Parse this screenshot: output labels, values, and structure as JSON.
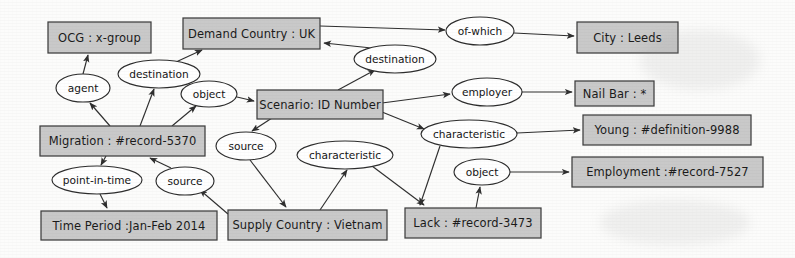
{
  "diagram": {
    "type": "entity-relationship-graph",
    "style": {
      "entity_fill": "#c9c9c9",
      "entity_stroke": "#3d3d3d",
      "relation_fill": "#ffffff",
      "relation_stroke": "#2c2c2c",
      "background": "#fcfcfb"
    },
    "entities": [
      {
        "id": "ocg",
        "label": "OCG : x-group",
        "x": 48,
        "y": 22,
        "w": 103,
        "h": 31
      },
      {
        "id": "demand",
        "label": "Demand Country : UK",
        "x": 183,
        "y": 18,
        "w": 137,
        "h": 31
      },
      {
        "id": "city",
        "label": "City : Leeds",
        "x": 577,
        "y": 22,
        "w": 101,
        "h": 31
      },
      {
        "id": "scenario",
        "label": "Scenario: ID Number",
        "x": 257,
        "y": 90,
        "w": 126,
        "h": 29
      },
      {
        "id": "nailbar",
        "label": "Nail Bar : *",
        "x": 575,
        "y": 81,
        "w": 79,
        "h": 25
      },
      {
        "id": "young",
        "label": "Young : #definition-9988",
        "x": 583,
        "y": 115,
        "w": 168,
        "h": 30
      },
      {
        "id": "migration",
        "label": "Migration : #record-5370",
        "x": 40,
        "y": 126,
        "w": 165,
        "h": 30
      },
      {
        "id": "employ",
        "label": "Employment :#record-7527",
        "x": 572,
        "y": 157,
        "w": 191,
        "h": 30
      },
      {
        "id": "timeper",
        "label": "Time Period :Jan-Feb 2014",
        "x": 41,
        "y": 211,
        "w": 176,
        "h": 29
      },
      {
        "id": "supply",
        "label": "Supply Country : Vietnam",
        "x": 228,
        "y": 210,
        "w": 159,
        "h": 30
      },
      {
        "id": "lack",
        "label": "Lack : #record-3473",
        "x": 405,
        "y": 208,
        "w": 136,
        "h": 30
      }
    ],
    "relations": [
      {
        "id": "agent",
        "label": "agent",
        "cx": 83,
        "cy": 88,
        "rx": 27,
        "ry": 14
      },
      {
        "id": "dest1",
        "label": "destination",
        "cx": 159,
        "cy": 74,
        "rx": 41,
        "ry": 14
      },
      {
        "id": "object1",
        "label": "object",
        "cx": 209,
        "cy": 94,
        "rx": 28,
        "ry": 13
      },
      {
        "id": "dest2",
        "label": "destination",
        "cx": 395,
        "cy": 59,
        "rx": 41,
        "ry": 14
      },
      {
        "id": "ofwhich",
        "label": "of-which",
        "cx": 480,
        "cy": 31,
        "rx": 34,
        "ry": 14
      },
      {
        "id": "employer",
        "label": "employer",
        "cx": 487,
        "cy": 92,
        "rx": 35,
        "ry": 14
      },
      {
        "id": "charac1",
        "label": "characteristic",
        "cx": 469,
        "cy": 134,
        "rx": 48,
        "ry": 14
      },
      {
        "id": "object2",
        "label": "object",
        "cx": 482,
        "cy": 172,
        "rx": 28,
        "ry": 13
      },
      {
        "id": "source1",
        "label": "source",
        "cx": 246,
        "cy": 146,
        "rx": 30,
        "ry": 14
      },
      {
        "id": "charac2",
        "label": "characteristic",
        "cx": 345,
        "cy": 155,
        "rx": 48,
        "ry": 14
      },
      {
        "id": "pit",
        "label": "point-in-time",
        "cx": 97,
        "cy": 180,
        "rx": 45,
        "ry": 14
      },
      {
        "id": "source2",
        "label": "source",
        "cx": 185,
        "cy": 181,
        "rx": 29,
        "ry": 14
      }
    ],
    "edges": [
      {
        "from": "migration",
        "to": "agent",
        "path": "M 110 126 L 90 103",
        "arrow_at": [
          85,
          100
        ]
      },
      {
        "from": "agent",
        "to": "ocg",
        "path": "M 83 74 L 88 55",
        "arrow_at": [
          89,
          53
        ]
      },
      {
        "from": "migration",
        "to": "dest1",
        "path": "M 140 126 L 154 89",
        "arrow_at": [
          156,
          87
        ]
      },
      {
        "from": "dest1",
        "to": "demand",
        "path": "M 176 62 L 202 50",
        "arrow_at": [
          205,
          49
        ]
      },
      {
        "from": "migration",
        "to": "object1",
        "path": "M 172 126 L 196 106",
        "arrow_at": [
          199,
          104
        ]
      },
      {
        "from": "object1",
        "to": "scenario",
        "path": "M 237 97 L 254 101",
        "arrow_at": [
          256,
          102
        ]
      },
      {
        "from": "scenario",
        "to": "dest2",
        "path": "M 338 90 L 375 70",
        "arrow_at": [
          378,
          68
        ]
      },
      {
        "from": "dest2",
        "to": "demand",
        "path": "M 381 49 L 324 43",
        "arrow_at": [
          321,
          42
        ]
      },
      {
        "from": "demand",
        "to": "ofwhich",
        "path": "M 320 26 L 445 30",
        "arrow_at": [
          447,
          30
        ]
      },
      {
        "from": "ofwhich",
        "to": "city",
        "path": "M 514 33 L 574 36",
        "arrow_at": [
          576,
          36
        ]
      },
      {
        "from": "scenario",
        "to": "employer",
        "path": "M 382 103 L 450 94",
        "arrow_at": [
          452,
          94
        ]
      },
      {
        "from": "employer",
        "to": "nailbar",
        "path": "M 522 92 L 572 92",
        "arrow_at": [
          574,
          92
        ]
      },
      {
        "from": "scenario",
        "to": "charac1",
        "path": "M 382 112 L 424 129",
        "arrow_at": [
          427,
          131
        ]
      },
      {
        "from": "charac1",
        "to": "young",
        "path": "M 517 133 L 580 130",
        "arrow_at": [
          582,
          130
        ]
      },
      {
        "from": "object2",
        "to": "employ",
        "path": "M 510 172 L 569 172",
        "arrow_at": [
          571,
          172
        ]
      },
      {
        "from": "lack",
        "to": "object2",
        "path": "M 476 208 L 480 187",
        "arrow_at": [
          481,
          185
        ]
      },
      {
        "from": "charac1",
        "to": "lack",
        "path": "M 440 146 L 420 205",
        "arrow_at": [
          419,
          207
        ]
      },
      {
        "from": "scenario",
        "to": "source1",
        "path": "M 272 118 L 252 131",
        "arrow_at": [
          250,
          133
        ]
      },
      {
        "from": "source1",
        "to": "supply",
        "path": "M 250 160 L 286 207",
        "arrow_at": [
          288,
          209
        ]
      },
      {
        "from": "supply",
        "to": "charac2",
        "path": "M 320 210 L 347 170",
        "arrow_at": [
          348,
          168
        ]
      },
      {
        "from": "charac2",
        "to": "lack",
        "path": "M 372 166 L 424 205",
        "arrow_at": [
          426,
          207
        ]
      },
      {
        "from": "migration",
        "to": "pit",
        "path": "M 106 156 L 101 165",
        "arrow_at": [
          101,
          167
        ]
      },
      {
        "from": "pit",
        "to": "timeper",
        "path": "M 100 194 L 107 208",
        "arrow_at": [
          108,
          210
        ]
      },
      {
        "from": "source2",
        "to": "migration",
        "path": "M 171 168 L 150 158",
        "arrow_at": [
          148,
          156
        ]
      },
      {
        "from": "supply",
        "to": "source2",
        "path": "M 228 214 L 200 190",
        "arrow_at": [
          198,
          188
        ]
      }
    ]
  }
}
